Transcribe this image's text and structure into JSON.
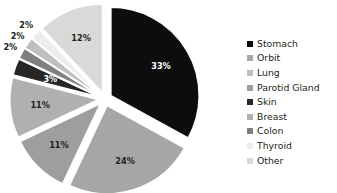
{
  "chart_data": {
    "type": "pie",
    "title": "",
    "exploded": true,
    "legend_position": "right",
    "grid": false,
    "value_suffix": "%",
    "categories": [
      "Stomach",
      "Orbit",
      "Lung",
      "Parotid Gland",
      "Skin",
      "Breast",
      "Colon",
      "Thyroid",
      "Other"
    ],
    "values": [
      33,
      24,
      2,
      11,
      3,
      11,
      2,
      2,
      12
    ],
    "colors": [
      "#0d0d0d",
      "#a6a6a6",
      "#bfbfbf",
      "#9e9e9e",
      "#262626",
      "#b0b0b0",
      "#808080",
      "#ededed",
      "#d9d9d9"
    ],
    "label_colors": [
      "#ffffff",
      "#231f20",
      "#231f20",
      "#231f20",
      "#ffffff",
      "#231f20",
      "#231f20",
      "#231f20",
      "#231f20"
    ],
    "slices": [
      {
        "label": "Stomach",
        "value": 33,
        "display": "33%",
        "color": "#0d0d0d",
        "label_color": "#ffffff"
      },
      {
        "label": "Orbit",
        "value": 24,
        "display": "24%",
        "color": "#a6a6a6",
        "label_color": "#231f20"
      },
      {
        "label": "Parotid Gland",
        "value": 11,
        "display": "11%",
        "color": "#9e9e9e",
        "label_color": "#231f20"
      },
      {
        "label": "Breast",
        "value": 11,
        "display": "11%",
        "color": "#b0b0b0",
        "label_color": "#231f20"
      },
      {
        "label": "Skin",
        "value": 3,
        "display": "3%",
        "color": "#262626",
        "label_color": "#ffffff"
      },
      {
        "label": "Colon",
        "value": 2,
        "display": "2%",
        "color": "#808080",
        "label_color": "#231f20"
      },
      {
        "label": "Lung",
        "value": 2,
        "display": "2%",
        "color": "#bfbfbf",
        "label_color": "#231f20"
      },
      {
        "label": "Thyroid",
        "value": 2,
        "display": "2%",
        "color": "#ededed",
        "label_color": "#231f20"
      },
      {
        "label": "Other",
        "value": 12,
        "display": "12%",
        "color": "#d9d9d9",
        "label_color": "#231f20"
      }
    ]
  },
  "legend": {
    "items": [
      {
        "label": "Stomach",
        "color": "#0d0d0d"
      },
      {
        "label": "Orbit",
        "color": "#a6a6a6"
      },
      {
        "label": "Lung",
        "color": "#bfbfbf"
      },
      {
        "label": "Parotid Gland",
        "color": "#9e9e9e"
      },
      {
        "label": "Skin",
        "color": "#262626"
      },
      {
        "label": "Breast",
        "color": "#b0b0b0"
      },
      {
        "label": "Colon",
        "color": "#808080"
      },
      {
        "label": "Thyroid",
        "color": "#ededed"
      },
      {
        "label": "Other",
        "color": "#d9d9d9"
      }
    ]
  }
}
